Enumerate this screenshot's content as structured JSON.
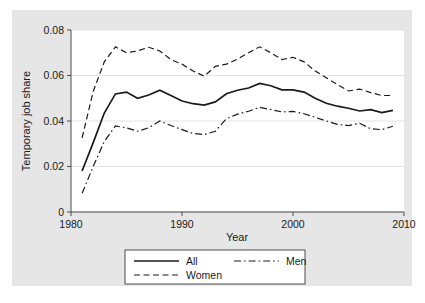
{
  "figure": {
    "background_color": "#e6e6e6",
    "plot_background_color": "#ffffff",
    "line_color": "#1a1a1a",
    "grid_color": "#dcdcdc"
  },
  "chart_data": {
    "type": "line",
    "title": "",
    "xlabel": "Year",
    "ylabel": "Temporary job share",
    "xlim": [
      1980,
      2010
    ],
    "ylim": [
      0,
      0.08
    ],
    "xticks": [
      1980,
      1990,
      2000,
      2010
    ],
    "xticklabels": [
      "1980",
      "1990",
      "2000",
      "2010"
    ],
    "yticks": [
      0,
      0.02,
      0.04,
      0.06,
      0.08
    ],
    "yticklabels": [
      "0",
      "0.02",
      "0.04",
      "0.06",
      "0.08"
    ],
    "grid": "horizontal",
    "legend_position": "below-axes",
    "x": [
      1981,
      1982,
      1983,
      1984,
      1985,
      1986,
      1987,
      1988,
      1989,
      1990,
      1991,
      1992,
      1993,
      1994,
      1995,
      1996,
      1997,
      1998,
      1999,
      2000,
      2001,
      2002,
      2003,
      2004,
      2005,
      2006,
      2007,
      2008,
      2009
    ],
    "series": [
      {
        "name": "All",
        "style": "solid",
        "values": [
          0.018,
          0.0305,
          0.0435,
          0.0519,
          0.0527,
          0.05,
          0.0514,
          0.0535,
          0.0512,
          0.0488,
          0.0476,
          0.047,
          0.0484,
          0.052,
          0.0535,
          0.0545,
          0.0565,
          0.0555,
          0.0537,
          0.0537,
          0.0527,
          0.05,
          0.0478,
          0.0465,
          0.0456,
          0.0444,
          0.045,
          0.0437,
          0.0447
        ]
      },
      {
        "name": "Women",
        "style": "dashed",
        "values": [
          0.0326,
          0.053,
          0.066,
          0.0726,
          0.07,
          0.0708,
          0.0724,
          0.0708,
          0.067,
          0.065,
          0.062,
          0.0597,
          0.064,
          0.065,
          0.0672,
          0.07,
          0.0726,
          0.07,
          0.067,
          0.068,
          0.066,
          0.062,
          0.059,
          0.056,
          0.0532,
          0.054,
          0.0525,
          0.0512,
          0.0512
        ]
      },
      {
        "name": "Men",
        "style": "dash-dot",
        "values": [
          0.0082,
          0.02,
          0.031,
          0.0378,
          0.037,
          0.0355,
          0.037,
          0.04,
          0.038,
          0.0362,
          0.0345,
          0.034,
          0.0355,
          0.041,
          0.043,
          0.0443,
          0.046,
          0.045,
          0.044,
          0.0442,
          0.0432,
          0.0416,
          0.04,
          0.0385,
          0.038,
          0.039,
          0.0366,
          0.0362,
          0.0377
        ]
      }
    ]
  },
  "legend": {
    "entries": [
      {
        "label": "All",
        "style": "solid"
      },
      {
        "label": "Men",
        "style": "dash-dot"
      },
      {
        "label": "Women",
        "style": "dashed"
      }
    ]
  }
}
